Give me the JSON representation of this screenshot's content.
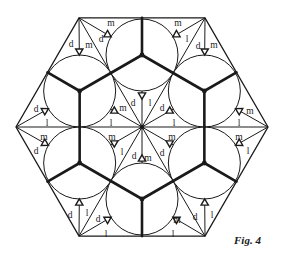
{
  "figure": {
    "caption": "Fig. 4",
    "hexagon": {
      "center": [
        142,
        127
      ],
      "side": 126
    },
    "circle_orbit": 72,
    "circle_radius": 36,
    "colors": {
      "ink": "#1a1a1a",
      "background": "#ffffff"
    },
    "labels": [
      {
        "t": "m",
        "x": 111,
        "y": 26
      },
      {
        "t": "d",
        "x": 71,
        "y": 47
      },
      {
        "t": "m",
        "x": 89,
        "y": 48
      },
      {
        "t": "d",
        "x": 101,
        "y": 42
      },
      {
        "t": "m",
        "x": 178,
        "y": 26
      },
      {
        "t": "l",
        "x": 187,
        "y": 42
      },
      {
        "t": "d",
        "x": 198,
        "y": 49
      },
      {
        "t": "m",
        "x": 214,
        "y": 48
      },
      {
        "t": "d",
        "x": 36,
        "y": 112
      },
      {
        "t": "l",
        "x": 47,
        "y": 126
      },
      {
        "t": "m",
        "x": 44,
        "y": 140
      },
      {
        "t": "d",
        "x": 36,
        "y": 154
      },
      {
        "t": "m",
        "x": 123,
        "y": 111
      },
      {
        "t": "d",
        "x": 133,
        "y": 106
      },
      {
        "t": "l",
        "x": 150,
        "y": 106
      },
      {
        "t": "d",
        "x": 162,
        "y": 111
      },
      {
        "t": "l",
        "x": 111,
        "y": 126
      },
      {
        "t": "m",
        "x": 112,
        "y": 140
      },
      {
        "t": "l",
        "x": 174,
        "y": 126
      },
      {
        "t": "m",
        "x": 172,
        "y": 140
      },
      {
        "t": "l",
        "x": 122,
        "y": 155
      },
      {
        "t": "d",
        "x": 134,
        "y": 159
      },
      {
        "t": "m",
        "x": 148,
        "y": 161
      },
      {
        "t": "d",
        "x": 162,
        "y": 156
      },
      {
        "t": "m",
        "x": 250,
        "y": 114
      },
      {
        "t": "l",
        "x": 239,
        "y": 126
      },
      {
        "t": "m",
        "x": 239,
        "y": 140
      },
      {
        "t": "l",
        "x": 248,
        "y": 154
      },
      {
        "t": "d",
        "x": 70,
        "y": 218
      },
      {
        "t": "l",
        "x": 87,
        "y": 216
      },
      {
        "t": "d",
        "x": 98,
        "y": 222
      },
      {
        "t": "l",
        "x": 106,
        "y": 237
      },
      {
        "t": "m",
        "x": 177,
        "y": 223
      },
      {
        "t": "d",
        "x": 195,
        "y": 220
      },
      {
        "t": "l",
        "x": 212,
        "y": 218
      },
      {
        "t": "l",
        "x": 173,
        "y": 237
      }
    ]
  }
}
